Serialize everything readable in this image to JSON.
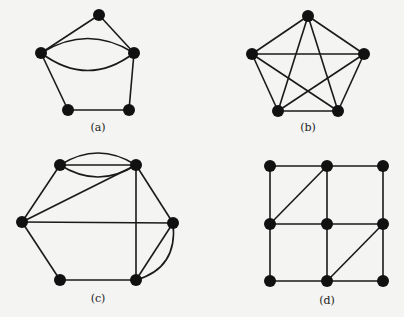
{
  "figures": [
    {
      "id": "a",
      "caption": "(a)",
      "caption_pos": [
        98,
        131
      ],
      "nodes": [
        [
          99,
          15
        ],
        [
          41,
          53
        ],
        [
          134,
          53
        ],
        [
          68,
          110
        ],
        [
          129,
          110
        ]
      ],
      "edges": [
        [
          0,
          1
        ],
        [
          0,
          2
        ],
        [
          1,
          3
        ],
        [
          3,
          4
        ],
        [
          4,
          2
        ]
      ],
      "curved_edges": [
        {
          "from": 1,
          "to": 2,
          "ctrl": [
            88,
            24
          ]
        },
        {
          "from": 1,
          "to": 2,
          "ctrl": [
            88,
            88
          ]
        }
      ]
    },
    {
      "id": "b",
      "caption": "(b)",
      "caption_pos": [
        308,
        131
      ],
      "nodes": [
        [
          308,
          16
        ],
        [
          252,
          54
        ],
        [
          364,
          54
        ],
        [
          278,
          111
        ],
        [
          338,
          111
        ]
      ],
      "edges": [
        [
          0,
          1
        ],
        [
          0,
          2
        ],
        [
          0,
          3
        ],
        [
          0,
          4
        ],
        [
          1,
          2
        ],
        [
          1,
          3
        ],
        [
          1,
          4
        ],
        [
          2,
          3
        ],
        [
          2,
          4
        ],
        [
          3,
          4
        ]
      ],
      "curved_edges": []
    },
    {
      "id": "c",
      "caption": "(c)",
      "caption_pos": [
        98,
        302
      ],
      "nodes": [
        [
          60,
          165
        ],
        [
          136,
          165
        ],
        [
          22,
          222
        ],
        [
          173,
          223
        ],
        [
          60,
          280
        ],
        [
          136,
          280
        ]
      ],
      "edges": [
        [
          0,
          1
        ],
        [
          0,
          2
        ],
        [
          1,
          2
        ],
        [
          1,
          3
        ],
        [
          1,
          5
        ],
        [
          2,
          3
        ],
        [
          2,
          4
        ],
        [
          4,
          5
        ],
        [
          3,
          5
        ]
      ],
      "curved_edges": [
        {
          "from": 0,
          "to": 1,
          "ctrl": [
            98,
            141
          ]
        },
        {
          "from": 0,
          "to": 1,
          "ctrl": [
            98,
            189
          ]
        },
        {
          "from": 3,
          "to": 5,
          "ctrl": [
            178,
            268
          ]
        }
      ]
    },
    {
      "id": "d",
      "caption": "(d)",
      "caption_pos": [
        327,
        304
      ],
      "nodes": [
        [
          270,
          166
        ],
        [
          327,
          166
        ],
        [
          383,
          166
        ],
        [
          270,
          224
        ],
        [
          327,
          224
        ],
        [
          383,
          224
        ],
        [
          270,
          281
        ],
        [
          327,
          281
        ],
        [
          383,
          281
        ]
      ],
      "edges": [
        [
          0,
          1
        ],
        [
          1,
          2
        ],
        [
          3,
          4
        ],
        [
          4,
          5
        ],
        [
          6,
          7
        ],
        [
          7,
          8
        ],
        [
          0,
          3
        ],
        [
          3,
          6
        ],
        [
          1,
          4
        ],
        [
          4,
          7
        ],
        [
          2,
          5
        ],
        [
          5,
          8
        ],
        [
          3,
          1
        ],
        [
          7,
          5
        ]
      ],
      "curved_edges": []
    }
  ],
  "style": {
    "node_radius": 6,
    "edge_color": "#1a1a1a",
    "node_color": "#111111",
    "background": "#f4f4f2"
  }
}
